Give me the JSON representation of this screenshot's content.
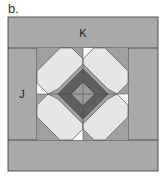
{
  "figure_label": "b.",
  "labels": {
    "top_band": "K",
    "left_band": "J"
  },
  "colors": {
    "border_band": "#a9a9a9",
    "light_patch": "#e6e6e6",
    "white_patch": "#ffffff",
    "mid_gray": "#a0a0a0",
    "dark_ring": "#5f5f5f",
    "center": "#9a9a9a",
    "line": "#333333"
  }
}
